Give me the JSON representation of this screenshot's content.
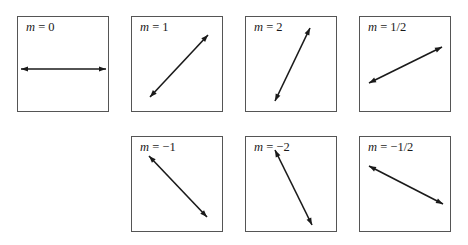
{
  "figure": {
    "panels": [
      {
        "id": "m0",
        "var": "m",
        "eq": " = ",
        "value": "0",
        "slope": 0,
        "line": [
          [
            3,
            52
          ],
          [
            88,
            52
          ]
        ]
      },
      {
        "id": "m1",
        "var": "m",
        "eq": " = ",
        "value": "1",
        "slope": 1,
        "line": [
          [
            18,
            80
          ],
          [
            76,
            18
          ]
        ]
      },
      {
        "id": "m2",
        "var": "m",
        "eq": " = ",
        "value": "2",
        "slope": 2,
        "line": [
          [
            29,
            84
          ],
          [
            64,
            11
          ]
        ]
      },
      {
        "id": "mhalf",
        "var": "m",
        "eq": " = ",
        "value": "1/2",
        "slope": 0.5,
        "line": [
          [
            9,
            66
          ],
          [
            82,
            30
          ]
        ]
      },
      {
        "id": "mneg1",
        "var": "m",
        "eq": " = ",
        "value": "−1",
        "slope": -1,
        "line": [
          [
            17,
            19
          ],
          [
            75,
            80
          ]
        ]
      },
      {
        "id": "mneg2",
        "var": "m",
        "eq": " = ",
        "value": "−2",
        "slope": -2,
        "line": [
          [
            29,
            13
          ],
          [
            66,
            88
          ]
        ]
      },
      {
        "id": "mneghalf",
        "var": "m",
        "eq": " = ",
        "value": "−1/2",
        "slope": -0.5,
        "line": [
          [
            9,
            29
          ],
          [
            83,
            67
          ]
        ]
      }
    ]
  }
}
